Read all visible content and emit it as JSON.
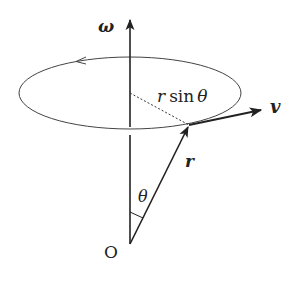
{
  "diagram": {
    "labels": {
      "omega": "ω",
      "r_sin_theta_r": "r",
      "r_sin_theta_sin": "sin",
      "r_sin_theta_theta": "θ",
      "v": "v",
      "r": "r",
      "theta": "θ",
      "origin": "O"
    },
    "elements": {
      "rotation_axis": {
        "from": [
          130,
          244
        ],
        "to": [
          130,
          18
        ],
        "label": "ω"
      },
      "circular_path": {
        "cx": 130,
        "cy": 93,
        "rx": 111,
        "ry": 36,
        "direction": "counterclockwise (arrow at top-left)"
      },
      "position_vector": {
        "from": [
          130,
          244
        ],
        "to": [
          189,
          125
        ],
        "label": "r"
      },
      "velocity_vector": {
        "from": [
          189,
          125
        ],
        "to": [
          262,
          110
        ],
        "label": "v"
      },
      "radius_dotted": {
        "from": [
          130,
          93
        ],
        "to": [
          189,
          125
        ],
        "label": "r sin θ"
      },
      "angle": {
        "label": "θ",
        "between": [
          "rotation_axis",
          "position_vector"
        ]
      }
    },
    "colors": {
      "stroke": "#222222",
      "background": "#ffffff"
    }
  }
}
